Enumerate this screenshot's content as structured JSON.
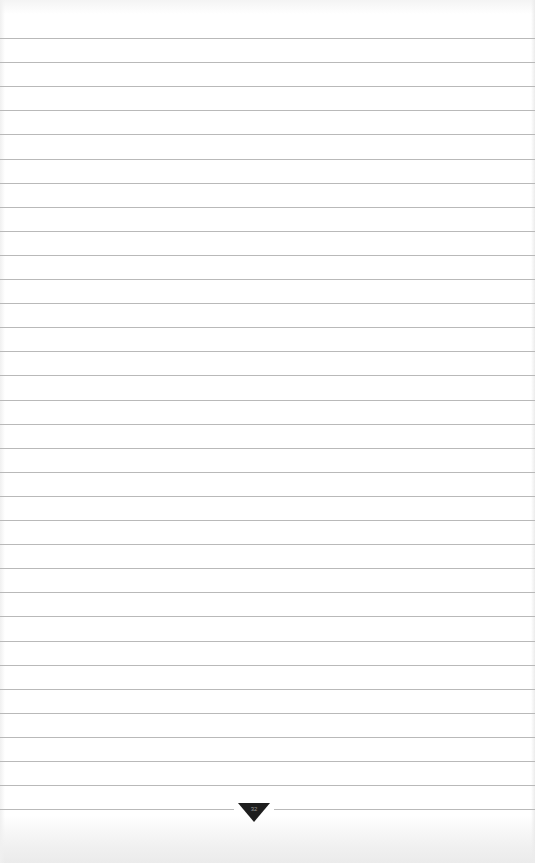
{
  "page": {
    "type": "lined-paper",
    "background_color": "#ffffff",
    "rule_color": "#b9b9b9",
    "rule_start_y": 38,
    "rule_spacing": 24.1,
    "rule_count": 33
  },
  "emblem": {
    "icon": "inverted-triangle-logo-icon",
    "color": "#1e1e1e",
    "mark_text": "32"
  }
}
